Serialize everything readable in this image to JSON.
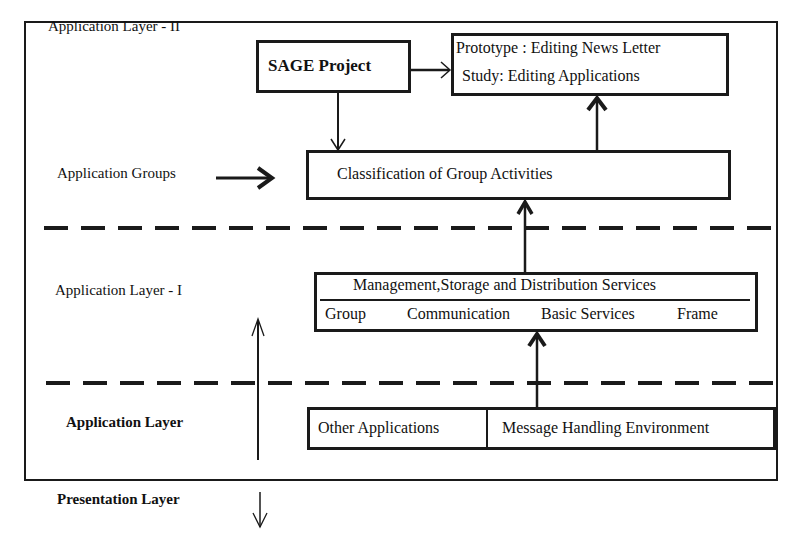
{
  "diagram": {
    "layer_labels": {
      "app_layer_2": "Application Layer - II",
      "app_groups": "Application Groups",
      "app_layer_1": "Application Layer - I",
      "app_layer": "Application Layer",
      "presentation_layer": "Presentation Layer"
    },
    "boxes": {
      "sage": "SAGE Project",
      "prototype_line1": "Prototype : Editing News Letter",
      "prototype_line2": "Study: Editing Applications",
      "classification": "Classification of Group Activities",
      "management_top": "Management,Storage and Distribution Services",
      "management_bottom": [
        "Group",
        "Communication",
        "Basic Services",
        "Frame"
      ],
      "other_applications": "Other Applications",
      "message_handling": "Message Handling Environment"
    },
    "colors": {
      "line": "#1a1a1a",
      "background": "#ffffff"
    }
  }
}
